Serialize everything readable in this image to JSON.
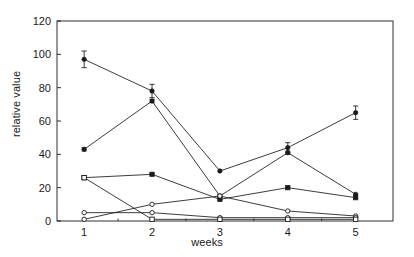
{
  "chart_data": {
    "type": "line",
    "title": "",
    "subtitle": "",
    "xlabel": "weeks",
    "ylabel": "relative value",
    "categories": [
      "1",
      "2",
      "3",
      "4",
      "5"
    ],
    "x": [
      1,
      2,
      3,
      4,
      5
    ],
    "xlim": [
      0.6,
      5.55
    ],
    "ylim": [
      0,
      120
    ],
    "yticks": [
      0,
      20,
      40,
      60,
      80,
      100,
      120
    ],
    "ytick_labels": [
      "0",
      "20",
      "40",
      "60",
      "80",
      "100",
      "120"
    ],
    "xticks": [
      1,
      2,
      3,
      4,
      5
    ],
    "xtick_labels": [
      "1",
      "2",
      "3",
      "4",
      "5"
    ],
    "x_minor_ticks": [
      1.5,
      2.5,
      3.5,
      4.5
    ],
    "grid": false,
    "frame": "box",
    "legend": "none",
    "line_color": "#1a1a1a",
    "background": "#ffffff",
    "error_bars": true,
    "series": [
      {
        "name": "series-1",
        "marker": "filled-circle",
        "values": [
          97,
          78,
          30,
          44,
          65
        ],
        "errors": [
          5,
          4,
          0,
          3,
          4
        ]
      },
      {
        "name": "series-2",
        "marker": "filled-circle",
        "values": [
          43,
          72,
          15,
          41,
          16
        ],
        "errors": [
          1,
          1,
          1,
          1,
          0
        ]
      },
      {
        "name": "series-3",
        "marker": "filled-square",
        "values": [
          26,
          28,
          13,
          20,
          14
        ],
        "errors": [
          0,
          0,
          0,
          0,
          0
        ]
      },
      {
        "name": "series-4",
        "marker": "open-circle",
        "values": [
          1,
          10,
          15,
          6,
          3
        ],
        "errors": [
          0,
          0,
          0,
          0,
          0
        ]
      },
      {
        "name": "series-5",
        "marker": "open-circle",
        "values": [
          5,
          5,
          2,
          2,
          2
        ],
        "errors": [
          0,
          0,
          0,
          0,
          0
        ]
      },
      {
        "name": "series-6",
        "marker": "open-square",
        "values": [
          26,
          1,
          1,
          1,
          1
        ],
        "errors": [
          0,
          0,
          0,
          0,
          0
        ]
      }
    ]
  }
}
